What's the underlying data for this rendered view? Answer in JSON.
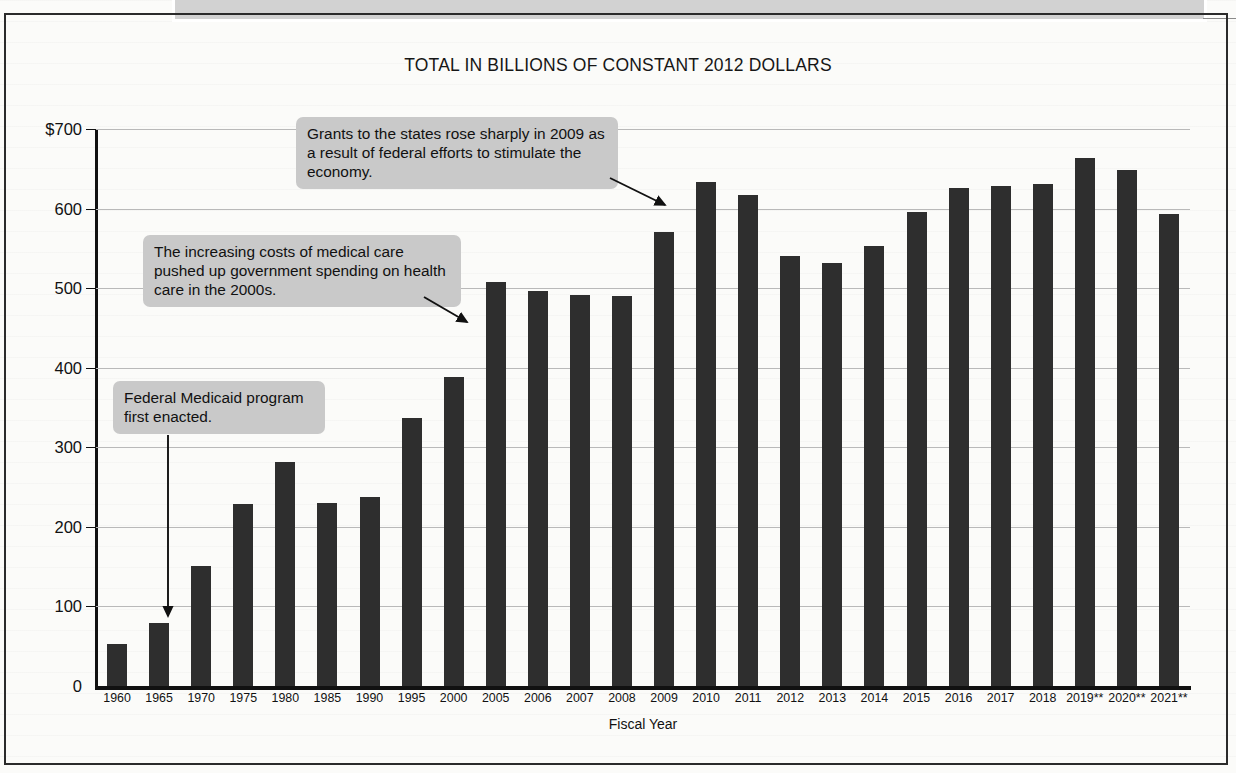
{
  "top_callout": {
    "question_text": "the steady increase in these grants?"
  },
  "chart_data": {
    "type": "bar",
    "title": "TOTAL IN BILLIONS OF CONSTANT 2012 DOLLARS",
    "xlabel": "Fiscal Year",
    "ylabel": "",
    "ylim": [
      0,
      700
    ],
    "grid": true,
    "legend": "none",
    "y_ticks": [
      "$700",
      "600",
      "500",
      "400",
      "300",
      "200",
      "100",
      "0"
    ],
    "y_tick_values": [
      700,
      600,
      500,
      400,
      300,
      200,
      100,
      0
    ],
    "categories": [
      "1960",
      "1965",
      "1970",
      "1975",
      "1980",
      "1985",
      "1990",
      "1995",
      "2000",
      "2005",
      "2006",
      "2007",
      "2008",
      "2009",
      "2010",
      "2011",
      "2012",
      "2013",
      "2014",
      "2015",
      "2016",
      "2017",
      "2018",
      "2019**",
      "2020**",
      "2021**"
    ],
    "values": [
      53,
      79,
      151,
      229,
      282,
      230,
      237,
      337,
      388,
      508,
      497,
      492,
      490,
      570,
      634,
      617,
      541,
      531,
      553,
      596,
      626,
      628,
      631,
      664,
      648,
      593
    ],
    "bar_color": "#2e2e2e",
    "annotations": [
      {
        "id": "callout-2009",
        "text": "Grants to the states rose sharply in 2009 as a result of federal efforts to stimulate the economy.",
        "points_to": "2009"
      },
      {
        "id": "callout-health",
        "text": "The increasing costs of medical care pushed up government spending on health care in the 2000s.",
        "points_to": "2005"
      },
      {
        "id": "callout-medicaid",
        "text": "Federal Medicaid program first enacted.",
        "points_to": "1965"
      }
    ]
  }
}
